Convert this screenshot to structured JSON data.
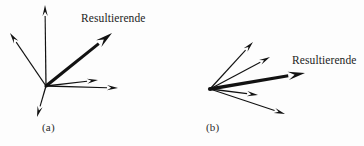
{
  "figure": {
    "background_color": "#fdfdfd",
    "stroke_color": "#121212",
    "text_color": "#1c1c1c",
    "width": 364,
    "height": 146
  },
  "panels": [
    {
      "id": "a",
      "caption": "(a)",
      "caption_x": 42,
      "caption_y": 121,
      "origin": {
        "x": 46,
        "y": 86
      },
      "resultant_label": {
        "text": "Resultierende",
        "x": 81,
        "y": 12
      },
      "vectors": [
        {
          "name": "vector-up-left",
          "tip": {
            "x": 10,
            "y": 33
          },
          "weight": "thin",
          "is_resultant": false
        },
        {
          "name": "vector-vertical-up",
          "tip": {
            "x": 45,
            "y": 5
          },
          "weight": "thin",
          "is_resultant": false
        },
        {
          "name": "vector-resultant",
          "tip": {
            "x": 112,
            "y": 33
          },
          "weight": "thick",
          "is_resultant": true
        },
        {
          "name": "vector-right-upper",
          "tip": {
            "x": 98,
            "y": 80
          },
          "weight": "thin",
          "is_resultant": false
        },
        {
          "name": "vector-right-lower",
          "tip": {
            "x": 118,
            "y": 88
          },
          "weight": "thin",
          "is_resultant": false
        },
        {
          "name": "vector-down-left",
          "tip": {
            "x": 37,
            "y": 117
          },
          "weight": "thin",
          "is_resultant": false
        }
      ]
    },
    {
      "id": "b",
      "caption": "(b)",
      "caption_x": 206,
      "caption_y": 121,
      "origin": {
        "x": 210,
        "y": 89
      },
      "resultant_label": {
        "text": "Resultierende",
        "x": 292,
        "y": 54
      },
      "vectors": [
        {
          "name": "vector-fan-1",
          "tip": {
            "x": 253,
            "y": 42
          },
          "weight": "thin",
          "is_resultant": false
        },
        {
          "name": "vector-fan-2",
          "tip": {
            "x": 270,
            "y": 57
          },
          "weight": "thin",
          "is_resultant": false
        },
        {
          "name": "vector-resultant",
          "tip": {
            "x": 305,
            "y": 73
          },
          "weight": "thick",
          "is_resultant": true
        },
        {
          "name": "vector-fan-3",
          "tip": {
            "x": 258,
            "y": 95
          },
          "weight": "thin",
          "is_resultant": false
        },
        {
          "name": "vector-fan-4",
          "tip": {
            "x": 285,
            "y": 114
          },
          "weight": "thin",
          "is_resultant": false
        }
      ]
    }
  ]
}
